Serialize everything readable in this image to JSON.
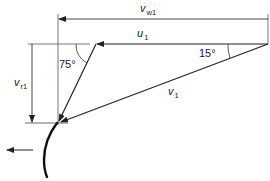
{
  "diagram": {
    "type": "velocity-triangle",
    "labels": {
      "vw1": {
        "main": "v",
        "sub": "w1"
      },
      "u1": {
        "main": "u",
        "sub": "1"
      },
      "vr1": {
        "main": "v",
        "sub": "r1"
      },
      "v1": {
        "main": "v",
        "sub": "1"
      },
      "angle_15": "15°",
      "angle_75": "75°"
    },
    "colors": {
      "line": "#2a2a2a",
      "blade": "#111111",
      "background": "#ffffff"
    }
  }
}
